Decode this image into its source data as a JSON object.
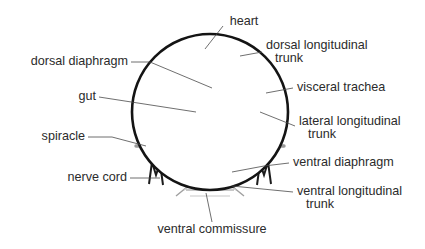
{
  "colors": {
    "body_wall": "#141414",
    "diaphragm": "#4d4d4d",
    "trunk_major": "#9a9a9a",
    "trunk_minor": "#b4b4b4",
    "trachea_fine": "#c3c3c3",
    "node": "#838383",
    "gut_outline": "#2e2e2e",
    "leader_line": "#4a4a4a",
    "label_text": "#2b2b2b",
    "background": "#ffffff"
  },
  "labels": {
    "heart": "heart",
    "dorsal_diaphragm": "dorsal diaphragm",
    "gut": "gut",
    "spiracle": "spiracle",
    "nerve_cord": "nerve cord",
    "dorsal_longitudinal_trunk_line1": "dorsal longitudinal",
    "dorsal_longitudinal_trunk_line2": "trunk",
    "visceral_trachea": "visceral trachea",
    "lateral_longitudinal_trunk_line1": "lateral longitudinal",
    "lateral_longitudinal_trunk_line2": "trunk",
    "ventral_diaphragm": "ventral diaphragm",
    "ventral_longitudinal_trunk_line1": "ventral longitudinal",
    "ventral_longitudinal_trunk_line2": "trunk",
    "ventral_commissure": "ventral commissure"
  },
  "geometry": {
    "body_center_x": 210,
    "body_center_y": 112,
    "body_radius": 78,
    "gut_outer_radius": 37,
    "gut_inner_radius": 30,
    "gut_tick_count": 54,
    "heart_cx": 209,
    "heart_cy": 46,
    "heart_rx": 8,
    "heart_ry": 10
  }
}
